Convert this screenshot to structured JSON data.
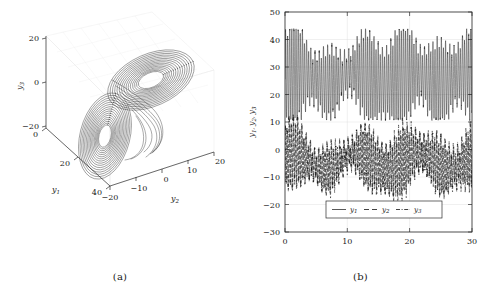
{
  "figure": {
    "panels": [
      {
        "id": "a",
        "caption": "(a)",
        "type": "phase-portrait-3d"
      },
      {
        "id": "b",
        "caption": "(b)",
        "type": "time-series"
      }
    ]
  },
  "chart_data": [
    {
      "type": "line",
      "subtype": "3d-phase-portrait",
      "title": "",
      "panel": "(a)",
      "xlabel": "y1",
      "ylabel": "y2",
      "zlabel": "y3",
      "xlabel_display": "y₁",
      "ylabel_display": "y₂",
      "zlabel_display": "y₃",
      "x_ticks": [
        0,
        20,
        40
      ],
      "y_ticks": [
        -20,
        -10,
        0,
        10,
        20
      ],
      "z_ticks": [
        -20,
        0,
        20
      ],
      "xlim": [
        0,
        45
      ],
      "ylim": [
        -20,
        22
      ],
      "zlim": [
        -25,
        25
      ],
      "grid": true,
      "legend": "none",
      "description": "Double-scroll chaotic attractor with two lobes traced by a single trajectory",
      "series": [
        {
          "name": "trajectory",
          "style": "solid",
          "color": "#1f1f1f"
        }
      ]
    },
    {
      "type": "line",
      "subtype": "time-series",
      "title": "",
      "panel": "(b)",
      "xlabel": "t",
      "ylabel": "y1, y2, y3",
      "ylabel_display": "y₁, y₂, y₃",
      "xlim": [
        0,
        30
      ],
      "ylim": [
        -30,
        50
      ],
      "x_ticks": [
        0,
        10,
        20,
        30
      ],
      "y_ticks": [
        -30,
        -20,
        -10,
        0,
        10,
        20,
        30,
        40,
        50
      ],
      "grid": true,
      "legend_position": "bottom-center",
      "series": [
        {
          "name": "y1",
          "name_display": "y₁",
          "style": "solid",
          "color": "#111111",
          "range": [
            10,
            44
          ],
          "mean": 27
        },
        {
          "name": "y2",
          "name_display": "y₂",
          "style": "dashed",
          "color": "#111111",
          "range": [
            -20,
            16
          ],
          "mean": -4
        },
        {
          "name": "y3",
          "name_display": "y₃",
          "style": "dashdot",
          "color": "#111111",
          "range": [
            -20,
            16
          ],
          "mean": -4
        }
      ]
    }
  ],
  "colors": {
    "axis": "#2b2b2b",
    "grid": "#d8d8d8",
    "trace": "#111111",
    "background": "#ffffff"
  }
}
